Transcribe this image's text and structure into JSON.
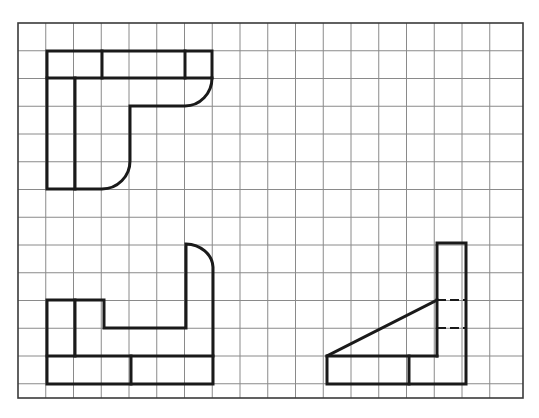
{
  "diagram": {
    "type": "orthographic-projection-views",
    "grid": {
      "x0": 18,
      "y0": 23,
      "x1": 523,
      "y1": 398,
      "cell": 27.75,
      "columns": 18,
      "rows": 13.5,
      "line_color": "#8a8a8a",
      "border_color": "#3a3a3a"
    },
    "stroke_color": "#1a1a1a",
    "views": [
      {
        "name": "top-view",
        "position": "top-left"
      },
      {
        "name": "front-view",
        "position": "bottom-left"
      },
      {
        "name": "side-view",
        "position": "bottom-right",
        "has_hidden_lines": true
      }
    ]
  }
}
